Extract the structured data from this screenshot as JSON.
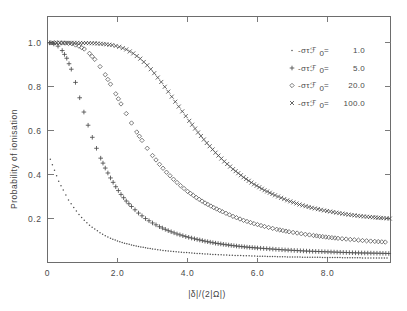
{
  "figure": {
    "background": "#ffffff",
    "frame_color": "#6d6d6d"
  },
  "chart_data": {
    "type": "scatter",
    "title": "",
    "xlabel": "|δ|/(2|Ω|)",
    "ylabel": "Probability of ionisation",
    "xlim": [
      0,
      9.8
    ],
    "ylim": [
      0,
      1.12
    ],
    "xticks": [
      0,
      2.0,
      4.0,
      6.0,
      8.0
    ],
    "xtick_labels": [
      "0",
      "2.0",
      "4.0",
      "6.0",
      "8.0"
    ],
    "yticks": [
      0.2,
      0.4,
      0.6,
      0.8,
      1.0
    ],
    "ytick_labels": [
      "0.2",
      "0.4",
      "0.6",
      "0.8",
      "1.0"
    ],
    "grid": false,
    "legend_position": "upper-right",
    "series": [
      {
        "name": "-στℱ₀ =   1.0",
        "marker": "dot",
        "symbol": "·",
        "value": "1.0",
        "color": "#4d4d4d",
        "x": [
          0.08,
          0.2,
          0.32,
          0.45,
          0.6,
          0.75,
          0.9,
          1.05,
          1.2,
          1.35,
          1.5,
          1.65,
          1.8,
          2.0,
          2.2,
          2.4,
          2.6,
          2.8,
          3.0,
          3.3,
          3.6,
          3.9,
          4.2,
          4.5,
          4.8,
          5.2,
          5.6,
          6.0,
          6.5,
          7.0,
          7.5,
          8.0,
          8.5,
          9.0,
          9.4,
          9.7
        ],
        "y": [
          0.47,
          0.42,
          0.37,
          0.33,
          0.285,
          0.25,
          0.218,
          0.192,
          0.17,
          0.152,
          0.136,
          0.122,
          0.11,
          0.098,
          0.088,
          0.08,
          0.073,
          0.067,
          0.062,
          0.055,
          0.05,
          0.046,
          0.042,
          0.039,
          0.036,
          0.033,
          0.031,
          0.029,
          0.027,
          0.025,
          0.024,
          0.023,
          0.022,
          0.021,
          0.021,
          0.02
        ]
      },
      {
        "name": "-στℱ₀ =   5.0",
        "marker": "plus",
        "symbol": "+",
        "value": "5.0",
        "color": "#4d4d4d",
        "x": [
          0.06,
          0.18,
          0.3,
          0.42,
          0.55,
          0.68,
          0.8,
          0.92,
          1.04,
          1.16,
          1.28,
          1.4,
          1.52,
          1.65,
          1.8,
          1.95,
          2.1,
          2.25,
          2.4,
          2.6,
          2.8,
          3.0,
          3.2,
          3.45,
          3.7,
          3.95,
          4.2,
          4.5,
          4.8,
          5.1,
          5.4,
          5.7,
          6.0,
          6.35,
          6.7,
          7.05,
          7.4,
          7.75,
          8.1,
          8.45,
          8.8,
          9.15,
          9.5,
          9.75
        ],
        "y": [
          1.0,
          0.995,
          0.985,
          0.965,
          0.93,
          0.88,
          0.82,
          0.75,
          0.685,
          0.625,
          0.57,
          0.52,
          0.475,
          0.43,
          0.385,
          0.345,
          0.31,
          0.28,
          0.255,
          0.225,
          0.2,
          0.18,
          0.163,
          0.145,
          0.13,
          0.118,
          0.108,
          0.097,
          0.088,
          0.081,
          0.075,
          0.07,
          0.066,
          0.062,
          0.058,
          0.055,
          0.052,
          0.05,
          0.048,
          0.046,
          0.044,
          0.043,
          0.042,
          0.041
        ]
      },
      {
        "name": "-στℱ₀ =  20.0",
        "marker": "diamond",
        "symbol": "⋄",
        "value": "20.0",
        "color": "#5a5a5a",
        "x": [
          0.1,
          0.3,
          0.5,
          0.7,
          0.9,
          1.05,
          1.2,
          1.35,
          1.5,
          1.65,
          1.8,
          1.95,
          2.1,
          2.25,
          2.4,
          2.55,
          2.7,
          2.85,
          3.0,
          3.2,
          3.4,
          3.6,
          3.8,
          4.0,
          4.25,
          4.5,
          4.75,
          5.0,
          5.3,
          5.6,
          5.9,
          6.2,
          6.55,
          6.9,
          7.25,
          7.6,
          7.95,
          8.3,
          8.65,
          9.0,
          9.35,
          9.65
        ],
        "y": [
          1.0,
          1.0,
          0.999,
          0.996,
          0.985,
          0.972,
          0.952,
          0.925,
          0.892,
          0.855,
          0.812,
          0.768,
          0.722,
          0.678,
          0.635,
          0.594,
          0.556,
          0.52,
          0.487,
          0.447,
          0.411,
          0.379,
          0.35,
          0.324,
          0.296,
          0.271,
          0.25,
          0.231,
          0.21,
          0.192,
          0.177,
          0.164,
          0.151,
          0.14,
          0.131,
          0.123,
          0.116,
          0.11,
          0.105,
          0.1,
          0.096,
          0.093
        ]
      },
      {
        "name": "-στℱ₀ = 100.0",
        "marker": "x",
        "symbol": "×",
        "value": "100.0",
        "color": "#4d4d4d",
        "x": [
          0.1,
          0.35,
          0.6,
          0.85,
          1.1,
          1.35,
          1.6,
          1.85,
          2.05,
          2.25,
          2.45,
          2.65,
          2.85,
          3.05,
          3.25,
          3.45,
          3.65,
          3.85,
          4.05,
          4.3,
          4.55,
          4.8,
          5.05,
          5.3,
          5.6,
          5.9,
          6.2,
          6.5,
          6.85,
          7.2,
          7.55,
          7.9,
          8.25,
          8.6,
          8.95,
          9.3,
          9.6,
          9.78
        ],
        "y": [
          1.0,
          1.0,
          1.0,
          1.0,
          0.999,
          0.998,
          0.995,
          0.99,
          0.982,
          0.97,
          0.952,
          0.928,
          0.898,
          0.862,
          0.822,
          0.778,
          0.732,
          0.688,
          0.645,
          0.592,
          0.544,
          0.5,
          0.46,
          0.425,
          0.388,
          0.356,
          0.329,
          0.306,
          0.283,
          0.264,
          0.249,
          0.237,
          0.227,
          0.218,
          0.211,
          0.206,
          0.202,
          0.2
        ]
      }
    ]
  },
  "legend": {
    "entries": [
      {
        "symbol": "·",
        "label": "-στℱ",
        "sub": "0",
        "eq": "=",
        "value": "1.0"
      },
      {
        "symbol": "+",
        "label": "-στℱ",
        "sub": "0",
        "eq": "=",
        "value": "5.0"
      },
      {
        "symbol": "⋄",
        "label": "-στℱ",
        "sub": "0",
        "eq": "=",
        "value": "20.0"
      },
      {
        "symbol": "×",
        "label": "-στℱ",
        "sub": "0",
        "eq": "=",
        "value": "100.0"
      }
    ]
  }
}
